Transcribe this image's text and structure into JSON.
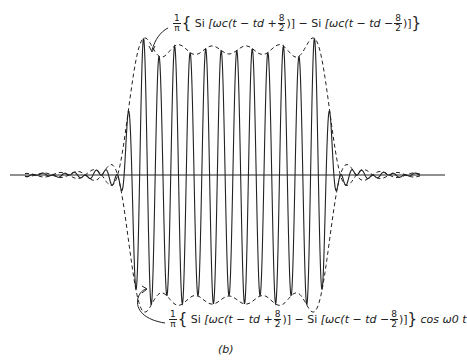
{
  "figure": {
    "caption": "(b)",
    "top_label": {
      "prefix_num": "1",
      "prefix_den": "π",
      "open": "{",
      "si1": "Si",
      "term1": "[ωc(t − td +",
      "frac1_num": "8",
      "frac1_den": "2",
      "close1": ")]",
      "minus": "− Si",
      "term2": "[ωc(t − td −",
      "frac2_num": "8",
      "frac2_den": "2",
      "close2": ")]",
      "close": "}"
    },
    "bottom_label": {
      "prefix_num": "1",
      "prefix_den": "π",
      "open": "{",
      "si1": "Si",
      "term1": "[ωc(t − td +",
      "frac1_num": "8",
      "frac1_den": "2",
      "close1": ")]",
      "minus": "− Si",
      "term2": "[ωc(t − td −",
      "frac2_num": "8",
      "frac2_den": "2",
      "close2": ")]",
      "close": "}",
      "suffix": "cos ω0 t"
    }
  },
  "diagram": {
    "axis_y": 175,
    "axis_x_start": 10,
    "axis_x_end": 445,
    "pulse_left": 128,
    "pulse_right": 330,
    "carrier_cycles_in_pulse": 13,
    "envelope": "dashed",
    "carrier": "solid",
    "colors": {
      "ink": "#222222",
      "background": "#ffffff"
    }
  }
}
